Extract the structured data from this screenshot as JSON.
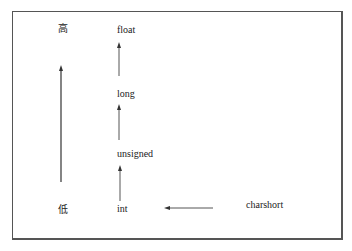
{
  "diagram": {
    "title": "",
    "axis": {
      "high_label": "高",
      "low_label": "低"
    },
    "nodes": [
      {
        "id": "float",
        "label": "float"
      },
      {
        "id": "long",
        "label": "long"
      },
      {
        "id": "unsigned",
        "label": "unsigned"
      },
      {
        "id": "int",
        "label": "int"
      },
      {
        "id": "charshort",
        "label": "charshort"
      }
    ],
    "edges": [
      {
        "from": "int",
        "to": "unsigned"
      },
      {
        "from": "unsigned",
        "to": "long"
      },
      {
        "from": "long",
        "to": "float"
      },
      {
        "from": "charshort",
        "to": "int"
      }
    ],
    "colors": {
      "line": "#333333",
      "border": "#555555",
      "text": "#222222"
    }
  }
}
